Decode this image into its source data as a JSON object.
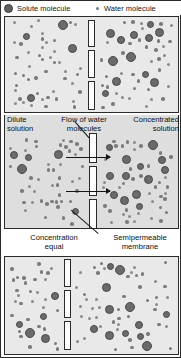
{
  "figure": {
    "background_color": "#ffffff",
    "panel_fill": "#e9e9e9",
    "panel_fill_middle": "#dedede",
    "border_color": "#2b2b2b",
    "solute_color": "#6a6a6a",
    "water_color": "#8a8a8a",
    "pore_fill": "#fdfdfd",
    "arrow_color": "#151515"
  },
  "legend": {
    "items": [
      {
        "icon": "large-filled-circle",
        "label": "Solute molecule"
      },
      {
        "icon": "small-filled-dot",
        "label": "Water molecule"
      }
    ]
  },
  "panels": [
    {
      "id": "panel-initial",
      "order": 1,
      "captions": [],
      "membrane": {
        "pores": 3,
        "x_center_pct": 50
      },
      "left_side": {
        "state": "dilute",
        "solute_count": 4,
        "water_count": 46
      },
      "right_side": {
        "state": "concentrated",
        "solute_count": 12,
        "water_count": 38
      },
      "arrows": 0
    },
    {
      "id": "panel-flow",
      "order": 2,
      "captions": [
        {
          "name": "dilute-solution-label",
          "text": "Dilute\nsolution",
          "align": "left"
        },
        {
          "name": "flow-of-water-label",
          "text": "Flow of water\nmolecules",
          "align": "center"
        },
        {
          "name": "concentrated-solution-label",
          "text": "Concentrated\nsolution",
          "align": "right"
        }
      ],
      "membrane": {
        "pores": 3,
        "x_center_pct": 52
      },
      "left_side": {
        "state": "dilute",
        "solute_count": 5,
        "water_count": 44
      },
      "right_side": {
        "state": "concentrated",
        "solute_count": 13,
        "water_count": 40
      },
      "arrows": 2,
      "arrow_direction": "left-to-right"
    },
    {
      "id": "panel-equilibrium",
      "order": 3,
      "captions": [
        {
          "name": "concentration-equal-label",
          "text": "Concentration\nequal",
          "align": "left"
        },
        {
          "name": "semipermeable-membrane-label",
          "text": "Semipermeable\nmembrane",
          "align": "right"
        }
      ],
      "membrane": {
        "pores": 3,
        "x_center_pct": 36
      },
      "left_side": {
        "state": "equal",
        "solute_count": 5,
        "water_count": 30
      },
      "right_side": {
        "state": "equal",
        "solute_count": 12,
        "water_count": 46
      },
      "arrows": 0,
      "leader_line": {
        "from": "semipermeable-membrane-label",
        "to": "membrane-pore"
      }
    }
  ]
}
